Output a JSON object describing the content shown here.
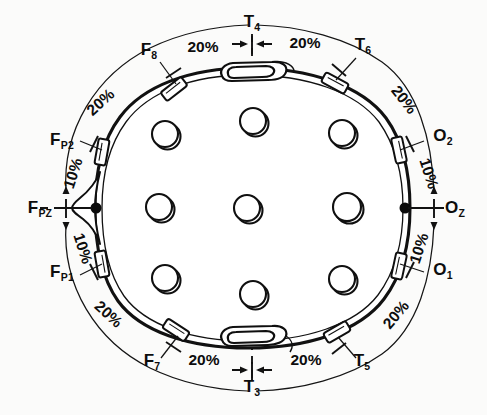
{
  "figure": {
    "background_color": "#fbfbfa",
    "ink_color": "#111111"
  },
  "chart_data": {
    "type": "diagram",
    "orientation": "nose at left, inion at right",
    "axis_ranges": {
      "x": [
        0,
        487
      ],
      "y": [
        0,
        415
      ]
    },
    "grid": false,
    "legend": "none",
    "anchor_points": [
      {
        "name": "nasion-dot",
        "x": 96,
        "y": 208
      },
      {
        "name": "inion-dot",
        "x": 405,
        "y": 208
      }
    ],
    "electrode_labels": [
      {
        "id": "F8",
        "base": "F",
        "sub": "8",
        "x": 149,
        "y": 55,
        "anchor": "middle"
      },
      {
        "id": "T4",
        "base": "T",
        "sub": "4",
        "x": 252,
        "y": 27,
        "anchor": "middle"
      },
      {
        "id": "T6",
        "base": "T",
        "sub": "6",
        "x": 363,
        "y": 50,
        "anchor": "middle"
      },
      {
        "id": "FP2",
        "base": "F",
        "sub": "P2",
        "x": 62,
        "y": 145,
        "anchor": "middle"
      },
      {
        "id": "FPZ",
        "base": "F",
        "sub": "PZ",
        "x": 40,
        "y": 213,
        "anchor": "middle"
      },
      {
        "id": "FP1",
        "base": "F",
        "sub": "P1",
        "x": 62,
        "y": 277,
        "anchor": "middle"
      },
      {
        "id": "O2",
        "base": "O",
        "sub": "2",
        "x": 443,
        "y": 141,
        "anchor": "middle"
      },
      {
        "id": "OZ",
        "base": "O",
        "sub": "Z",
        "x": 455,
        "y": 213,
        "anchor": "middle"
      },
      {
        "id": "O1",
        "base": "O",
        "sub": "1",
        "x": 443,
        "y": 275,
        "anchor": "middle"
      },
      {
        "id": "F7",
        "base": "F",
        "sub": "7",
        "x": 152,
        "y": 366,
        "anchor": "middle"
      },
      {
        "id": "T3",
        "base": "T",
        "sub": "3",
        "x": 252,
        "y": 392,
        "anchor": "middle"
      },
      {
        "id": "T5",
        "base": "T",
        "sub": "5",
        "x": 362,
        "y": 366,
        "anchor": "middle"
      }
    ],
    "percent_labels": [
      {
        "value": "20%",
        "x": 203,
        "y": 52,
        "rotate": 0,
        "region": "top-left-of-T4"
      },
      {
        "value": "20%",
        "x": 305,
        "y": 48,
        "rotate": 0,
        "region": "top-right-of-T4"
      },
      {
        "value": "20%",
        "x": 104,
        "y": 106,
        "rotate": -42,
        "region": "upper-left"
      },
      {
        "value": "20%",
        "x": 400,
        "y": 103,
        "rotate": 52,
        "region": "upper-right"
      },
      {
        "value": "10%",
        "x": 78,
        "y": 175,
        "rotate": -72,
        "region": "left-upper"
      },
      {
        "value": "10%",
        "x": 78,
        "y": 250,
        "rotate": 72,
        "region": "left-lower"
      },
      {
        "value": "10%",
        "x": 424,
        "y": 175,
        "rotate": 72,
        "region": "right-upper"
      },
      {
        "value": "10%",
        "x": 424,
        "y": 250,
        "rotate": -72,
        "region": "right-lower"
      },
      {
        "value": "20%",
        "x": 105,
        "y": 318,
        "rotate": 42,
        "region": "lower-left"
      },
      {
        "value": "20%",
        "x": 400,
        "y": 318,
        "rotate": -50,
        "region": "lower-right"
      },
      {
        "value": "20%",
        "x": 204,
        "y": 365,
        "rotate": 0,
        "region": "bottom-left-of-T3"
      },
      {
        "value": "20%",
        "x": 306,
        "y": 365,
        "rotate": 0,
        "region": "bottom-right-of-T3"
      }
    ],
    "interior_electrode_holes": [
      {
        "name": "hole-front-left",
        "cx": 165,
        "cy": 134,
        "r": 13
      },
      {
        "name": "hole-front-center",
        "cx": 253,
        "cy": 121,
        "r": 13
      },
      {
        "name": "hole-front-right",
        "cx": 342,
        "cy": 133,
        "r": 13
      },
      {
        "name": "hole-mid-left",
        "cx": 159,
        "cy": 207,
        "r": 13
      },
      {
        "name": "hole-center",
        "cx": 247,
        "cy": 208,
        "r": 13
      },
      {
        "name": "hole-mid-right",
        "cx": 347,
        "cy": 207,
        "r": 14
      },
      {
        "name": "hole-rear-left",
        "cx": 165,
        "cy": 278,
        "r": 13
      },
      {
        "name": "hole-rear-center",
        "cx": 253,
        "cy": 294,
        "r": 13
      },
      {
        "name": "hole-rear-right",
        "cx": 342,
        "cy": 279,
        "r": 13
      }
    ],
    "perimeter_tabs": [
      {
        "name": "tab-F8",
        "cx": 174,
        "cy": 89,
        "angle": -38
      },
      {
        "name": "tab-T6",
        "cx": 335,
        "cy": 83,
        "angle": 28
      },
      {
        "name": "tab-FP2",
        "cx": 102,
        "cy": 152,
        "angle": -80
      },
      {
        "name": "tab-O2",
        "cx": 399,
        "cy": 150,
        "angle": 78
      },
      {
        "name": "tab-FP1",
        "cx": 102,
        "cy": 264,
        "angle": 80
      },
      {
        "name": "tab-O1",
        "cx": 399,
        "cy": 266,
        "angle": -78
      },
      {
        "name": "tab-F7",
        "cx": 176,
        "cy": 330,
        "angle": 33
      },
      {
        "name": "tab-T5",
        "cx": 337,
        "cy": 332,
        "angle": -30
      }
    ],
    "ear_clips": [
      {
        "name": "clip-T4-top",
        "cx": 252,
        "cy": 71
      },
      {
        "name": "clip-T3-bottom",
        "cx": 252,
        "cy": 345
      }
    ],
    "dashed_axes": [
      {
        "name": "horizontal-axis",
        "x1": 40,
        "y1": 208,
        "x2": 445,
        "y2": 208
      },
      {
        "name": "vertical-axis",
        "x1": 252,
        "y1": 34,
        "x2": 252,
        "y2": 382
      }
    ]
  }
}
